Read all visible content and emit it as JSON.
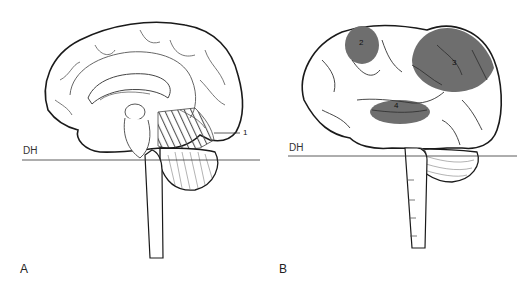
{
  "figure": {
    "panels": [
      {
        "id": "A",
        "letter": "A",
        "view": "medial sagittal brain",
        "line_label": "DH",
        "regions": [
          {
            "number": "1",
            "style": "hatched",
            "location": "occipital/visual cortex (medial)"
          }
        ]
      },
      {
        "id": "B",
        "letter": "B",
        "view": "lateral brain",
        "line_label": "DH",
        "regions": [
          {
            "number": "2",
            "style": "shaded",
            "location": "parietal (posterior-superior)"
          },
          {
            "number": "3",
            "style": "shaded",
            "location": "frontal"
          },
          {
            "number": "4",
            "style": "shaded",
            "location": "temporal"
          }
        ]
      }
    ],
    "colors": {
      "outline": "#1a1a1a",
      "sulci": "#444444",
      "shading": "#6e6e6e",
      "hatch": "#555555",
      "background": "#ffffff"
    }
  }
}
